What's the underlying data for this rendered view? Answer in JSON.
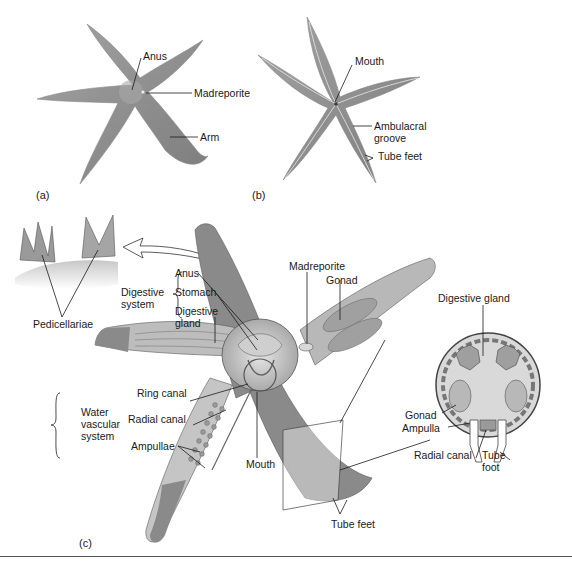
{
  "panels": {
    "a": {
      "letter": "(a)",
      "view": "aboral",
      "labels": {
        "anus": "Anus",
        "madreporite": "Madreporite",
        "arm": "Arm"
      }
    },
    "b": {
      "letter": "(b)",
      "view": "oral",
      "labels": {
        "mouth": "Mouth",
        "ambulacral_groove_1": "Ambulacral",
        "ambulacral_groove_2": "groove",
        "tube_feet": "Tube feet"
      }
    },
    "c": {
      "letter": "(c)",
      "view": "dissection",
      "inset": {
        "pedicellariae": "Pedicellariae"
      },
      "groups": {
        "digestive": {
          "line1": "Digestive",
          "line2": "system",
          "items": [
            "Anus",
            "Stomach",
            "Digestive",
            "gland"
          ]
        },
        "water_vascular": {
          "line1": "Water",
          "line2": "vascular",
          "line3": "system",
          "items": [
            "Ring canal",
            "Radial canal",
            "Ampullae"
          ]
        }
      },
      "labels": {
        "madreporite": "Madreporite",
        "gonad": "Gonad",
        "mouth": "Mouth",
        "tube_feet": "Tube feet"
      },
      "cross_section": {
        "digestive_gland": "Digestive gland",
        "gonad": "Gonad",
        "ampulla": "Ampulla",
        "radial_canal": "Radial canal",
        "tube_foot_1": "Tube",
        "tube_foot_2": "foot"
      }
    }
  },
  "colors": {
    "body_fill": "#8e8e8e",
    "body_light": "#b5b5b5",
    "body_dark": "#6a6a6a",
    "interior": "#d2d2d2",
    "line": "#1a1a1a"
  }
}
